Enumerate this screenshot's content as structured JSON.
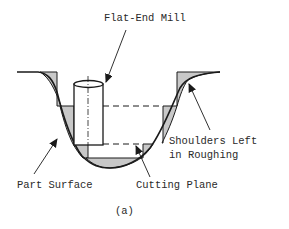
{
  "figure": {
    "caption": "(a)",
    "labels": {
      "tool": "Flat-End Mill",
      "shoulders_line1": "Shoulders Left",
      "shoulders_line2": "in Roughing",
      "part_surface": "Part Surface",
      "cutting_plane": "Cutting Plane"
    },
    "colors": {
      "line": "#1a1a1a",
      "shoulder_fill": "#c8c8c8",
      "background": "#ffffff"
    }
  }
}
